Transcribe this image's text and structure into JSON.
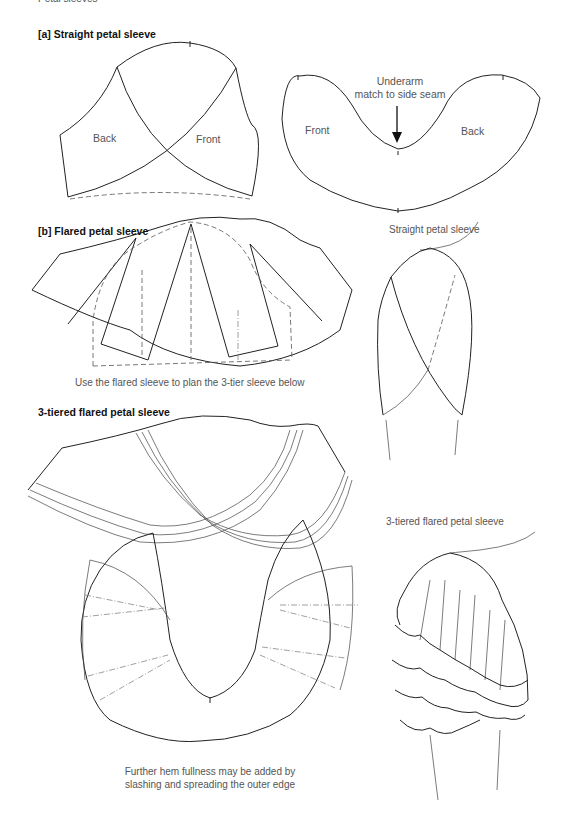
{
  "page": {
    "running_head": "Petal sleeves"
  },
  "section_a": {
    "title": "[a] Straight petal sleeve",
    "left_pattern": {
      "labels": {
        "back": "Back",
        "front": "Front"
      }
    },
    "right_pattern": {
      "labels": {
        "front": "Front",
        "back": "Back"
      },
      "annotation_line1": "Underarm",
      "annotation_line2": "match to side seam"
    }
  },
  "section_b": {
    "title": "[b] Flared petal sleeve",
    "caption": "Use the flared sleeve to plan the 3-tier sleeve below"
  },
  "illustration_straight": {
    "caption": "Straight petal sleeve"
  },
  "section_c": {
    "title": "3-tiered flared petal sleeve",
    "caption_line1": "Further hem fullness may be added by",
    "caption_line2": "slashing and spreading the outer edge"
  },
  "illustration_tiered": {
    "caption": "3-tiered flared petal sleeve"
  }
}
